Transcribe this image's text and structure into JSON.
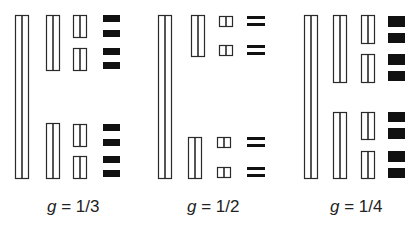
{
  "colors": {
    "stroke": "#2a2a2a",
    "fill_open": "#ffffff",
    "fill_solid": "#111111",
    "background": "#ffffff"
  },
  "panels": [
    {
      "label_var": "g",
      "label_value": "= 1/3",
      "label_x": 47,
      "shapes": [
        {
          "kind": "split",
          "x": 15,
          "y": 15,
          "w": 13,
          "h": 163
        },
        {
          "kind": "split",
          "x": 46,
          "y": 15,
          "w": 13,
          "h": 55
        },
        {
          "kind": "split",
          "x": 46,
          "y": 123,
          "w": 13,
          "h": 55
        },
        {
          "kind": "split",
          "x": 73,
          "y": 15,
          "w": 13,
          "h": 22
        },
        {
          "kind": "split",
          "x": 73,
          "y": 48,
          "w": 13,
          "h": 22
        },
        {
          "kind": "split",
          "x": 73,
          "y": 124,
          "w": 13,
          "h": 22
        },
        {
          "kind": "split",
          "x": 73,
          "y": 156,
          "w": 13,
          "h": 22
        },
        {
          "kind": "solid",
          "x": 103,
          "y": 15,
          "w": 17,
          "h": 7
        },
        {
          "kind": "solid",
          "x": 103,
          "y": 30,
          "w": 17,
          "h": 7
        },
        {
          "kind": "solid",
          "x": 103,
          "y": 48,
          "w": 17,
          "h": 7
        },
        {
          "kind": "solid",
          "x": 103,
          "y": 62,
          "w": 17,
          "h": 7
        },
        {
          "kind": "solid",
          "x": 103,
          "y": 124,
          "w": 17,
          "h": 7
        },
        {
          "kind": "solid",
          "x": 103,
          "y": 139,
          "w": 17,
          "h": 7
        },
        {
          "kind": "solid",
          "x": 103,
          "y": 156,
          "w": 17,
          "h": 7
        },
        {
          "kind": "solid",
          "x": 103,
          "y": 170,
          "w": 17,
          "h": 7
        }
      ]
    },
    {
      "label_var": "g",
      "label_value": "= 1/2",
      "label_x": 187,
      "shapes": [
        {
          "kind": "split",
          "x": 158,
          "y": 15,
          "w": 13,
          "h": 163
        },
        {
          "kind": "split",
          "x": 191,
          "y": 15,
          "w": 13,
          "h": 41
        },
        {
          "kind": "split",
          "x": 188,
          "y": 137,
          "w": 13,
          "h": 41
        },
        {
          "kind": "split",
          "x": 219,
          "y": 16,
          "w": 13,
          "h": 10
        },
        {
          "kind": "split",
          "x": 219,
          "y": 45,
          "w": 13,
          "h": 10
        },
        {
          "kind": "split",
          "x": 217,
          "y": 137,
          "w": 13,
          "h": 10
        },
        {
          "kind": "split",
          "x": 217,
          "y": 167,
          "w": 13,
          "h": 10
        },
        {
          "kind": "bars",
          "x": 247,
          "y": 16,
          "w": 18,
          "h": 10
        },
        {
          "kind": "bars",
          "x": 247,
          "y": 45,
          "w": 18,
          "h": 10
        },
        {
          "kind": "bars",
          "x": 247,
          "y": 137,
          "w": 18,
          "h": 10
        },
        {
          "kind": "bars",
          "x": 247,
          "y": 167,
          "w": 18,
          "h": 10
        }
      ]
    },
    {
      "label_var": "g",
      "label_value": "= 1/4",
      "label_x": 330,
      "shapes": [
        {
          "kind": "split",
          "x": 304,
          "y": 15,
          "w": 13,
          "h": 163
        },
        {
          "kind": "split",
          "x": 333,
          "y": 15,
          "w": 13,
          "h": 67
        },
        {
          "kind": "split",
          "x": 333,
          "y": 112,
          "w": 13,
          "h": 66
        },
        {
          "kind": "split",
          "x": 361,
          "y": 15,
          "w": 13,
          "h": 28
        },
        {
          "kind": "split",
          "x": 361,
          "y": 54,
          "w": 13,
          "h": 28
        },
        {
          "kind": "split",
          "x": 361,
          "y": 112,
          "w": 13,
          "h": 27
        },
        {
          "kind": "split",
          "x": 361,
          "y": 151,
          "w": 13,
          "h": 27
        },
        {
          "kind": "solid",
          "x": 388,
          "y": 16,
          "w": 17,
          "h": 11
        },
        {
          "kind": "solid",
          "x": 388,
          "y": 33,
          "w": 17,
          "h": 10
        },
        {
          "kind": "solid",
          "x": 388,
          "y": 54,
          "w": 17,
          "h": 11
        },
        {
          "kind": "solid",
          "x": 388,
          "y": 71,
          "w": 17,
          "h": 10
        },
        {
          "kind": "solid",
          "x": 388,
          "y": 112,
          "w": 17,
          "h": 10
        },
        {
          "kind": "solid",
          "x": 388,
          "y": 128,
          "w": 17,
          "h": 11
        },
        {
          "kind": "solid",
          "x": 388,
          "y": 151,
          "w": 17,
          "h": 11
        },
        {
          "kind": "solid",
          "x": 388,
          "y": 168,
          "w": 17,
          "h": 10
        }
      ]
    }
  ]
}
